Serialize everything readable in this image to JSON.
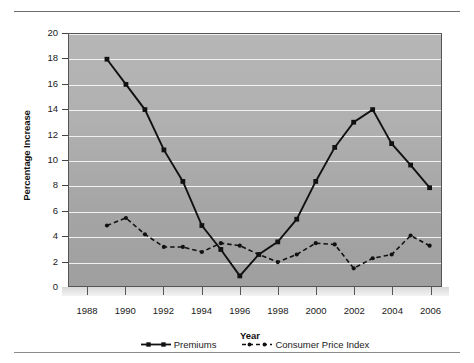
{
  "chart_data": {
    "type": "line",
    "title": "",
    "xlabel": "Year",
    "ylabel": "Percentage Increase",
    "xlim": [
      1987,
      2006.6
    ],
    "ylim": [
      0,
      20
    ],
    "ytick_step": 2,
    "yticks": [
      0,
      2,
      4,
      6,
      8,
      10,
      12,
      14,
      16,
      18,
      20
    ],
    "xticks": [
      1988,
      1990,
      1992,
      1994,
      1996,
      1998,
      2000,
      2002,
      2004,
      2006
    ],
    "grid": "horizontal",
    "legend_position": "bottom",
    "plot_background": "#b0b0b0",
    "series_color": "#111111",
    "x": [
      1989,
      1990,
      1991,
      1992,
      1993,
      1994,
      1995,
      1996,
      1997,
      1998,
      1999,
      2000,
      2001,
      2002,
      2003,
      2004,
      2005,
      2006
    ],
    "series": [
      {
        "name": "Premiums",
        "style": "solid",
        "marker": "square",
        "values": [
          18.0,
          16.0,
          14.0,
          10.8,
          8.3,
          4.8,
          2.9,
          0.8,
          2.5,
          3.5,
          5.3,
          8.3,
          11.0,
          13.0,
          14.0,
          11.3,
          9.6,
          7.8
        ]
      },
      {
        "name": "Consumer Price Index",
        "style": "dashed",
        "marker": "circle",
        "values": [
          4.8,
          5.4,
          4.1,
          3.1,
          3.1,
          2.7,
          3.4,
          3.2,
          2.5,
          1.9,
          2.5,
          3.4,
          3.3,
          1.4,
          2.2,
          2.5,
          4.0,
          3.2
        ]
      }
    ]
  }
}
